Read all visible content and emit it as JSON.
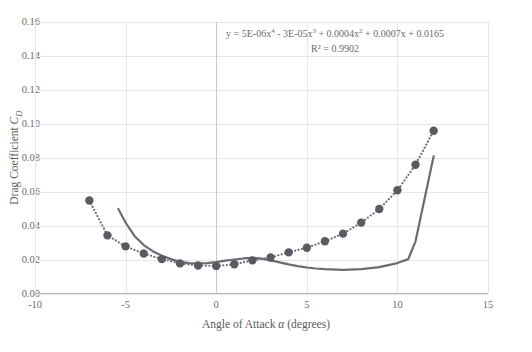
{
  "chart_data": {
    "type": "scatter",
    "title": "",
    "xlabel": "Angle of Attack α (degrees)",
    "ylabel": "Drag Coefficient C_D",
    "xlim": [
      -10,
      15
    ],
    "ylim": [
      0.0,
      0.16
    ],
    "xticks": [
      "-10",
      "-5",
      "0",
      "5",
      "10",
      "15"
    ],
    "xtick_values": [
      -10,
      -5,
      0,
      5,
      10,
      15
    ],
    "yticks": [
      "0.00",
      "0.02",
      "0.04",
      "0.06",
      "0.08",
      "0.10",
      "0.12",
      "0.14",
      "0.16"
    ],
    "ytick_values": [
      0.0,
      0.02,
      0.04,
      0.06,
      0.08,
      0.1,
      0.12,
      0.14,
      0.16
    ],
    "grid": true,
    "legend": "none",
    "annotation_equation": "y = 5E-06x⁴ - 3E-05x³ + 0.0004x² + 0.0007x + 0.0165",
    "annotation_r2": "R² = 0.9902",
    "marker_color": "#5a5a63",
    "line_color": "#6b6b72",
    "series": [
      {
        "name": "measured-points",
        "style": "scatter-with-dotted-trendline",
        "x": [
          -7.0,
          -6.0,
          -5.0,
          -4.0,
          -3.0,
          -2.0,
          -1.0,
          0.0,
          1.0,
          2.0,
          3.0,
          4.0,
          5.0,
          6.0,
          7.0,
          8.0,
          9.0,
          10.0,
          11.0,
          12.0
        ],
        "y": [
          0.055,
          0.0345,
          0.028,
          0.0238,
          0.0205,
          0.018,
          0.0168,
          0.0165,
          0.0175,
          0.0198,
          0.0215,
          0.0245,
          0.0272,
          0.031,
          0.0355,
          0.042,
          0.05,
          0.061,
          0.076,
          0.096
        ]
      },
      {
        "name": "trendline-fit",
        "style": "dotted",
        "x": [
          -7.0,
          -6.0,
          -5.0,
          -4.0,
          -3.0,
          -2.0,
          -1.0,
          0.0,
          1.0,
          2.0,
          3.0,
          4.0,
          5.0,
          6.0,
          7.0,
          8.0,
          9.0,
          10.0,
          11.0,
          12.0
        ],
        "y": [
          0.055,
          0.0345,
          0.028,
          0.0238,
          0.0205,
          0.018,
          0.0168,
          0.0165,
          0.0175,
          0.0198,
          0.0215,
          0.0245,
          0.0272,
          0.031,
          0.0355,
          0.042,
          0.05,
          0.061,
          0.076,
          0.096
        ]
      },
      {
        "name": "reference-curve",
        "style": "solid",
        "x": [
          -5.4,
          -5.0,
          -4.5,
          -4.0,
          -3.5,
          -3.0,
          -2.5,
          -2.0,
          -1.5,
          -1.0,
          -0.5,
          0.0,
          0.5,
          1.0,
          1.5,
          2.0,
          2.5,
          3.0,
          3.5,
          4.0,
          4.5,
          5.0,
          5.5,
          6.0,
          7.0,
          8.0,
          9.0,
          10.0,
          10.6,
          11.0,
          12.0
        ],
        "y": [
          0.05,
          0.042,
          0.034,
          0.0288,
          0.0252,
          0.0225,
          0.0205,
          0.019,
          0.0182,
          0.018,
          0.0182,
          0.0188,
          0.0196,
          0.0203,
          0.0209,
          0.0213,
          0.0208,
          0.0198,
          0.0186,
          0.0174,
          0.0164,
          0.0156,
          0.015,
          0.0146,
          0.0142,
          0.0146,
          0.0158,
          0.0182,
          0.0205,
          0.031,
          0.081
        ]
      }
    ]
  },
  "axis": {
    "x_title": "Angle of Attack α (degrees)",
    "x_symbol": "α",
    "x_title_prefix": "Angle of Attack ",
    "x_title_suffix": " (degrees)",
    "y_title_prefix": "Drag Coefficient ",
    "y_symbol": "C",
    "y_subscript": "D"
  },
  "annotation": {
    "equation_prefix": "y = 5E-06x",
    "equation_full": "y = 5E-06x⁴ - 3E-05x³ + 0.0004x² + 0.0007x + 0.0165",
    "r2": "R² = 0.9902"
  }
}
